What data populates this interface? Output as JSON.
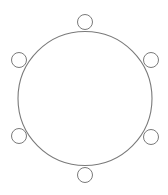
{
  "diagram": {
    "type": "round-table-seating",
    "stroke_color": "#7a7a7a",
    "background": "#ffffff",
    "table": {
      "cx": 85,
      "cy": 98.5,
      "r": 67
    },
    "chairs": [
      {
        "id": "top",
        "cx": 85,
        "cy": 22,
        "r": 7.5
      },
      {
        "id": "upper-right",
        "cx": 151,
        "cy": 60,
        "r": 7.5
      },
      {
        "id": "lower-right",
        "cx": 151,
        "cy": 137,
        "r": 7.5
      },
      {
        "id": "bottom",
        "cx": 85,
        "cy": 175,
        "r": 7.5
      },
      {
        "id": "lower-left",
        "cx": 19,
        "cy": 136,
        "r": 7.5
      },
      {
        "id": "upper-left",
        "cx": 19,
        "cy": 60,
        "r": 7.5
      }
    ],
    "chair_count": 6
  }
}
